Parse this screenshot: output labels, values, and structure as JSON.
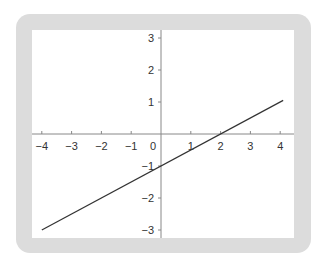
{
  "chart_data": {
    "type": "line",
    "title": "",
    "xlabel": "",
    "ylabel": "",
    "xlim": [
      -4.3,
      4.5
    ],
    "ylim": [
      -3.3,
      3.2
    ],
    "grid": false,
    "legend": null,
    "x_ticks": [
      -4,
      -3,
      -2,
      -1,
      0,
      1,
      2,
      3,
      4
    ],
    "x_tick_labels": [
      "−4",
      "−3",
      "−2",
      "−1",
      "0",
      "1",
      "2",
      "3",
      "4"
    ],
    "y_ticks": [
      -3,
      -2,
      -1,
      1,
      2,
      3
    ],
    "y_tick_labels": [
      "−3",
      "−2",
      "−1",
      "1",
      "2",
      "3"
    ],
    "series": [
      {
        "name": "y = 0.5x − 1",
        "x": [
          -4,
          4.1
        ],
        "y": [
          -3,
          1.05
        ],
        "color": "#333333"
      }
    ],
    "annotations": []
  },
  "colors": {
    "frame": "#dcdcdc",
    "plot_background": "#ffffff",
    "axis": "#888888",
    "line": "#333333"
  }
}
